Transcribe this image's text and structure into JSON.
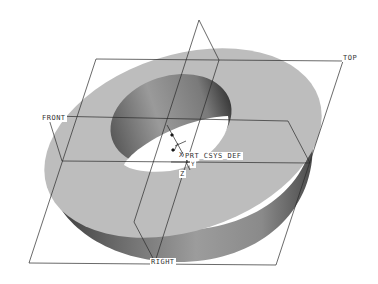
{
  "viewport": {
    "background": "#ffffff",
    "model": {
      "type": "thick-ring",
      "top_face_color": "#bdbdbd",
      "side_dark_color": "#3a3a3a",
      "side_light_color": "#a8a8a8",
      "hole_color": "#ffffff"
    },
    "datum_planes": [
      {
        "name": "FRONT",
        "label": "FRONT"
      },
      {
        "name": "TOP",
        "label": "TOP"
      },
      {
        "name": "RIGHT",
        "label": "RIGHT"
      }
    ],
    "coordinate_system": {
      "label": "PRT_CSYS_DEF",
      "axis_x": "X",
      "axis_y": "Y",
      "axis_z": "Z"
    },
    "line_color": "#2a2a2a"
  }
}
